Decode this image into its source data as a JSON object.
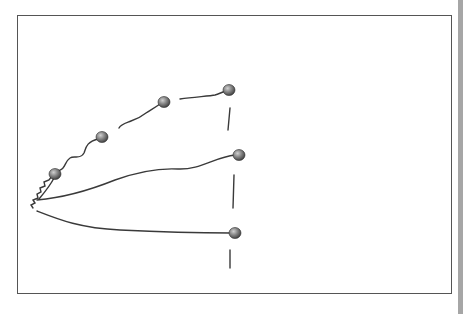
{
  "diagram": {
    "type": "hand-drawn branching tree",
    "colors": {
      "line": "#3a3a3a",
      "node_fill_light": "#b5b5b5",
      "node_fill_dark": "#4a4a4a",
      "frame": "#555555",
      "side_bar": "#a6a6a6"
    },
    "root": {
      "x": 33,
      "y": 208
    },
    "nodes": [
      {
        "id": "n1",
        "x": 55,
        "y": 174
      },
      {
        "id": "n2",
        "x": 102,
        "y": 137
      },
      {
        "id": "n3",
        "x": 164,
        "y": 102
      },
      {
        "id": "n4",
        "x": 229,
        "y": 90
      },
      {
        "id": "n5",
        "x": 239,
        "y": 155
      },
      {
        "id": "n6",
        "x": 235,
        "y": 233
      }
    ],
    "branches": [
      {
        "id": "upper-branch",
        "through": [
          "root",
          "n1",
          "n2",
          "n3",
          "n4"
        ]
      },
      {
        "id": "middle-branch",
        "through": [
          "root",
          "n5"
        ]
      },
      {
        "id": "lower-branch",
        "through": [
          "root",
          "n6"
        ]
      }
    ],
    "vertical_ticks": [
      {
        "x1": 230,
        "y1": 108,
        "x2": 228,
        "y2": 130
      },
      {
        "x1": 234,
        "y1": 175,
        "x2": 233,
        "y2": 208
      },
      {
        "x1": 230,
        "y1": 250,
        "x2": 230,
        "y2": 268
      }
    ]
  }
}
